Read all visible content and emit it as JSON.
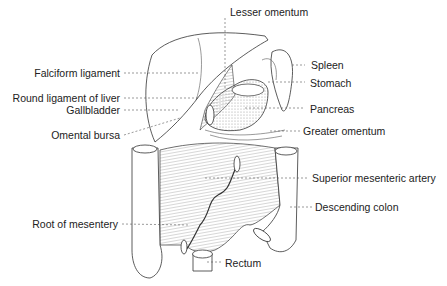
{
  "figure": {
    "labels": {
      "lesser_omentum": "Lesser omentum",
      "spleen": "Spleen",
      "falciform_ligament": "Falciform ligament",
      "stomach": "Stomach",
      "round_ligament_of_liver": "Round ligament of liver",
      "gallbladder": "Gallbladder",
      "pancreas": "Pancreas",
      "omental_bursa": "Omental bursa",
      "greater_omentum": "Greater omentum",
      "superior_mesenteric_artery": "Superior mesenteric artery",
      "descending_colon": "Descending colon",
      "root_of_mesentery": "Root of mesentery",
      "rectum": "Rectum"
    },
    "colors": {
      "line": "#333333",
      "text": "#222222",
      "shade": "#bbbbbb"
    }
  }
}
